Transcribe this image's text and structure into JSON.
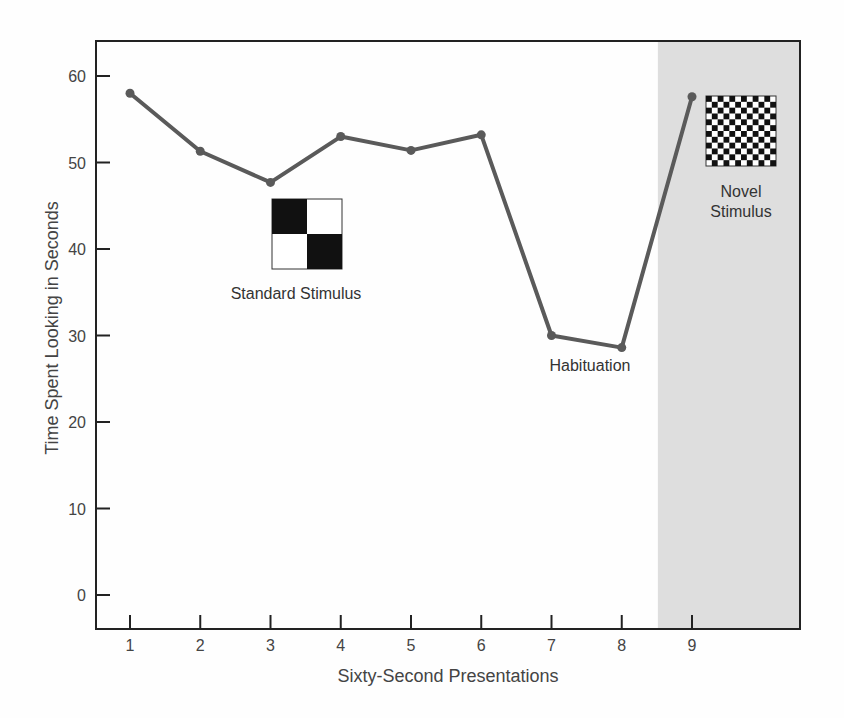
{
  "chart_data": {
    "type": "line",
    "title": "",
    "xlabel": "Sixty-Second Presentations",
    "ylabel": "Time Spent Looking in Seconds",
    "x": [
      1,
      2,
      3,
      4,
      5,
      6,
      7,
      8,
      9
    ],
    "x_tick_labels": [
      "1",
      "2",
      "3",
      "4",
      "5",
      "6",
      "7",
      "8",
      "9"
    ],
    "y_tick_labels": [
      "0",
      "10",
      "20",
      "30",
      "40",
      "50",
      "60"
    ],
    "y_ticks": [
      0,
      10,
      20,
      30,
      40,
      50,
      60
    ],
    "ylim": [
      -4,
      64
    ],
    "xlim": [
      0.5,
      10.5
    ],
    "grid": false,
    "legend": null,
    "series": [
      {
        "name": "Time spent looking",
        "values": [
          58,
          51.3,
          47.7,
          53,
          51.4,
          53.2,
          30,
          28.6,
          57.6
        ],
        "color": "#5a5a5a"
      }
    ],
    "shaded_region": {
      "x_from": 8.5,
      "x_to": 10.5,
      "color": "#dedede",
      "meaning": "novel stimulus phase"
    },
    "annotations": [
      {
        "text": "Standard Stimulus",
        "near_x": 3.5,
        "near_y": 38,
        "icon": "2x2 checkerboard"
      },
      {
        "text": "Habituation",
        "near_x": 7.9,
        "near_y": 26
      },
      {
        "text": "Novel Stimulus",
        "near_x": 9.6,
        "near_y": 52,
        "icon": "12x12 checkerboard"
      }
    ]
  },
  "labels": {
    "standard_stimulus": "Standard Stimulus",
    "habituation": "Habituation",
    "novel_line1": "Novel",
    "novel_line2": "Stimulus"
  },
  "colors": {
    "line": "#5a5a5a",
    "axis": "#222222",
    "shade": "#dedede",
    "text": "#444444"
  }
}
